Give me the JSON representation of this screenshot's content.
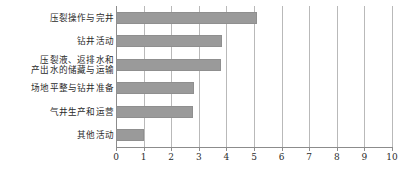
{
  "chart_data": {
    "type": "bar",
    "orientation": "horizontal",
    "title": "",
    "xlabel": "",
    "ylabel": "",
    "xlim": [
      0,
      10
    ],
    "xticks": [
      "0",
      "1",
      "2",
      "3",
      "4",
      "5",
      "6",
      "7",
      "8",
      "9",
      "10"
    ],
    "grid": true,
    "legend": false,
    "bar_color": "#9a9a9a",
    "grid_color": "#b9b9b9",
    "axis_color": "#8c8c8c",
    "categories": [
      "压裂操作与完井",
      "钻井活动",
      "压裂液、返排水和\n产出水的储藏与运输",
      "场地平整与钻井准备",
      "气井生产和运营",
      "其他活动"
    ],
    "values": [
      5.1,
      3.85,
      3.8,
      2.83,
      2.78,
      1.0
    ]
  }
}
